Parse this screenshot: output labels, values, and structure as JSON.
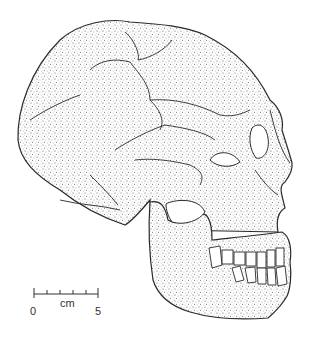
{
  "figure": {
    "ink_color": "#2a2a2a",
    "background": "#ffffff"
  },
  "scale_bar": {
    "unit_label": "cm",
    "start_label": "0",
    "end_label": "5",
    "ticks": 6
  }
}
